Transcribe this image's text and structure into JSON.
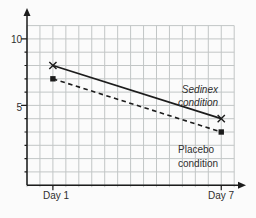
{
  "figure": {
    "background": "#fbfbfb",
    "axis_color": "#1c1c1c",
    "grid_color": "#c2c6c6",
    "text_color": "#2e2e2e"
  },
  "chart_data": {
    "type": "line",
    "title": "",
    "xlabel": "",
    "ylabel": "",
    "categories": [
      "Day 1",
      "Day 7"
    ],
    "series": [
      {
        "name": "Sedinex condition",
        "values": [
          8,
          4
        ],
        "line_style": "solid",
        "marker": "x",
        "color": "#1c1c1c"
      },
      {
        "name": "Placebo condition",
        "values": [
          7,
          3
        ],
        "line_style": "dashed",
        "marker": "filled-square",
        "color": "#1c1c1c"
      }
    ],
    "yticks_labeled": [
      10,
      5
    ],
    "ytick_minor_step": 1,
    "ylim_visible_rows": [
      -1,
      11
    ],
    "grid": true,
    "axis_arrows": [
      "y-top",
      "x-right"
    ],
    "annotations": [
      {
        "series": "Sedinex condition",
        "lines": [
          "Sedinex",
          "condition"
        ],
        "style": "italic",
        "position": "above-line-right"
      },
      {
        "series": "Placebo condition",
        "lines": [
          "Placebo",
          "condition"
        ],
        "style": "normal",
        "position": "below-line-right"
      }
    ]
  },
  "labels": {
    "ytick_10": "10",
    "ytick_5": "5",
    "xtick_day1": "Day 1",
    "xtick_day7": "Day 7",
    "sedinex_line1": "Sedinex",
    "sedinex_line2": "condition",
    "placebo_line1": "Placebo",
    "placebo_line2": "condition"
  }
}
